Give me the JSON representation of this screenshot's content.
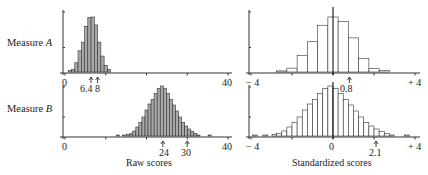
{
  "row_labels": {
    "a_prefix": "Measure ",
    "a_var": "A",
    "b_prefix": "Measure ",
    "b_var": "B"
  },
  "axis_titles": {
    "raw": "Raw scores",
    "standardized": "Standardized scores"
  },
  "raw_axis": {
    "min_label": "0",
    "max_label": "40"
  },
  "std_axis": {
    "min_label": "− 4",
    "zero_label": "0",
    "max_label": "+ 4"
  },
  "markers": {
    "a_mean": "6.4",
    "a_sd_point": "8",
    "b_mean": "24",
    "b_sd_point": "30",
    "a_std": "0.8",
    "b_std": "2.1"
  },
  "colors": {
    "raw_bar_fill": "#a8a8a8",
    "std_bar_fill": "#ffffff",
    "stroke": "#333333"
  },
  "chart_data": [
    {
      "type": "bar",
      "title": "Measure A — Raw scores",
      "xlabel": "Raw scores",
      "ylabel": "",
      "xlim": [
        0,
        40
      ],
      "x_ticks": [
        0,
        10,
        20,
        30,
        40
      ],
      "annotations": [
        {
          "x": 6.4,
          "label": "6.4"
        },
        {
          "x": 8,
          "label": "8"
        }
      ],
      "bin_width": 0.8,
      "x": [
        1.2,
        2.0,
        2.8,
        3.6,
        4.4,
        5.2,
        6.0,
        6.8,
        7.6,
        8.4,
        9.2,
        10.0,
        10.8,
        11.6
      ],
      "values": [
        2,
        4,
        14,
        32,
        45,
        69,
        82,
        83,
        71,
        45,
        24,
        10,
        4,
        0
      ],
      "fill": "gray"
    },
    {
      "type": "bar",
      "title": "Measure B — Raw scores",
      "xlabel": "Raw scores",
      "ylabel": "",
      "xlim": [
        0,
        40
      ],
      "x_ticks": [
        0,
        10,
        20,
        30,
        40
      ],
      "annotations": [
        {
          "x": 24,
          "label": "24"
        },
        {
          "x": 30,
          "label": "30"
        }
      ],
      "bin_width": 0.75,
      "x": [
        13.0,
        14.5,
        15.5,
        16.3,
        17.0,
        17.75,
        18.5,
        19.25,
        20.0,
        20.75,
        21.5,
        22.25,
        23.0,
        23.75,
        24.5,
        25.25,
        26.0,
        26.75,
        27.5,
        28.25,
        29.0,
        29.75,
        30.5,
        31.25,
        32.0,
        32.75,
        35.5
      ],
      "values": [
        2,
        2,
        3,
        5,
        10,
        18,
        27,
        38,
        52,
        64,
        73,
        85,
        95,
        100,
        95,
        85,
        73,
        62,
        50,
        38,
        27,
        20,
        14,
        9,
        5,
        2,
        2
      ],
      "fill": "gray"
    },
    {
      "type": "bar",
      "title": "Measure A — Standardized scores",
      "xlabel": "Standardized scores",
      "ylabel": "",
      "xlim": [
        -4,
        4
      ],
      "x_ticks": [
        -4,
        -2,
        0,
        2,
        4
      ],
      "annotations": [
        {
          "x": 0.8,
          "label": "0.8"
        }
      ],
      "bin_width": 0.5,
      "x": [
        -2.5,
        -2.0,
        -1.5,
        -1.0,
        -0.5,
        0.0,
        0.5,
        1.0,
        1.5,
        2.0,
        2.5
      ],
      "values": [
        2,
        7,
        30,
        55,
        85,
        100,
        92,
        62,
        25,
        6,
        3
      ],
      "fill": "white"
    },
    {
      "type": "bar",
      "title": "Measure B — Standardized scores",
      "xlabel": "Standardized scores",
      "ylabel": "",
      "xlim": [
        -4,
        4
      ],
      "x_ticks": [
        -4,
        -2,
        0,
        2,
        4
      ],
      "annotations": [
        {
          "x": 2.1,
          "label": "2.1"
        }
      ],
      "bin_width": 0.25,
      "x": [
        -3.8,
        -3.3,
        -2.85,
        -2.625,
        -2.375,
        -2.125,
        -1.875,
        -1.625,
        -1.375,
        -1.125,
        -0.875,
        -0.625,
        -0.375,
        -0.125,
        0.125,
        0.375,
        0.625,
        0.875,
        1.125,
        1.375,
        1.625,
        1.875,
        2.125,
        2.375,
        2.625,
        2.875,
        3.6
      ],
      "values": [
        2,
        2,
        3,
        5,
        10,
        18,
        27,
        38,
        52,
        64,
        73,
        85,
        95,
        100,
        95,
        85,
        73,
        62,
        50,
        38,
        27,
        20,
        14,
        9,
        5,
        2,
        2
      ],
      "fill": "white"
    }
  ]
}
